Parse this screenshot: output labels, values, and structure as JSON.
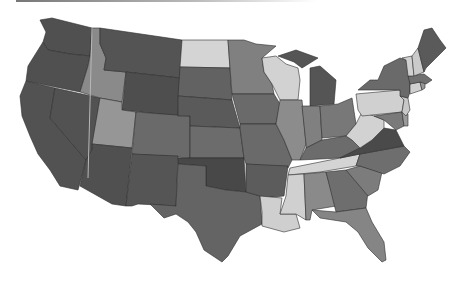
{
  "map": {
    "type": "choropleth",
    "region": "contiguous-united-states",
    "palette": {
      "darkest": "#4a4a4a",
      "dark": "#5c5c5c",
      "medium_dark": "#6e6e6e",
      "medium": "#838383",
      "medium_light": "#999999",
      "light": "#c9c9c9",
      "lightest": "#d8d8d8"
    },
    "states": [
      {
        "id": "WA",
        "shade": "#505050"
      },
      {
        "id": "OR",
        "shade": "#505050"
      },
      {
        "id": "CA",
        "shade": "#525252"
      },
      {
        "id": "NV",
        "shade": "#525252"
      },
      {
        "id": "ID",
        "shade": "#8a8a8a"
      },
      {
        "id": "MT",
        "shade": "#545454"
      },
      {
        "id": "WY",
        "shade": "#4e4e4e"
      },
      {
        "id": "UT",
        "shade": "#969696"
      },
      {
        "id": "AZ",
        "shade": "#505050"
      },
      {
        "id": "CO",
        "shade": "#6a6a6a"
      },
      {
        "id": "NM",
        "shade": "#555555"
      },
      {
        "id": "ND",
        "shade": "#d4d4d4"
      },
      {
        "id": "SD",
        "shade": "#626262"
      },
      {
        "id": "NE",
        "shade": "#5a5a5a"
      },
      {
        "id": "KS",
        "shade": "#6c6c6c"
      },
      {
        "id": "OK",
        "shade": "#484848"
      },
      {
        "id": "TX",
        "shade": "#646464"
      },
      {
        "id": "MN",
        "shade": "#808080"
      },
      {
        "id": "IA",
        "shade": "#6a6a6a"
      },
      {
        "id": "MO",
        "shade": "#6a6a6a"
      },
      {
        "id": "AR",
        "shade": "#5c5c5c"
      },
      {
        "id": "LA",
        "shade": "#cfcfcf"
      },
      {
        "id": "WI",
        "shade": "#d2d2d2"
      },
      {
        "id": "IL",
        "shade": "#8c8c8c"
      },
      {
        "id": "MI",
        "shade": "#555555"
      },
      {
        "id": "IN",
        "shade": "#808080"
      },
      {
        "id": "OH",
        "shade": "#787878"
      },
      {
        "id": "KY",
        "shade": "#6c6c6c"
      },
      {
        "id": "TN",
        "shade": "#d4d4d4"
      },
      {
        "id": "MS",
        "shade": "#d0d0d0"
      },
      {
        "id": "AL",
        "shade": "#8a8a8a"
      },
      {
        "id": "GA",
        "shade": "#6e6e6e"
      },
      {
        "id": "FL",
        "shade": "#858585"
      },
      {
        "id": "SC",
        "shade": "#7c7c7c"
      },
      {
        "id": "NC",
        "shade": "#6e6e6e"
      },
      {
        "id": "VA",
        "shade": "#4a4a4a"
      },
      {
        "id": "WV",
        "shade": "#d2d2d2"
      },
      {
        "id": "PA",
        "shade": "#d0d0d0"
      },
      {
        "id": "NY",
        "shade": "#6a6a6a"
      },
      {
        "id": "MD",
        "shade": "#7a7a7a"
      },
      {
        "id": "DE",
        "shade": "#9a9a9a"
      },
      {
        "id": "NJ",
        "shade": "#c8c8c8"
      },
      {
        "id": "CT",
        "shade": "#d0d0d0"
      },
      {
        "id": "RI",
        "shade": "#999999"
      },
      {
        "id": "MA",
        "shade": "#707070"
      },
      {
        "id": "VT",
        "shade": "#d0d0d0"
      },
      {
        "id": "NH",
        "shade": "#cacaca"
      },
      {
        "id": "ME",
        "shade": "#5a5a5a"
      }
    ]
  }
}
